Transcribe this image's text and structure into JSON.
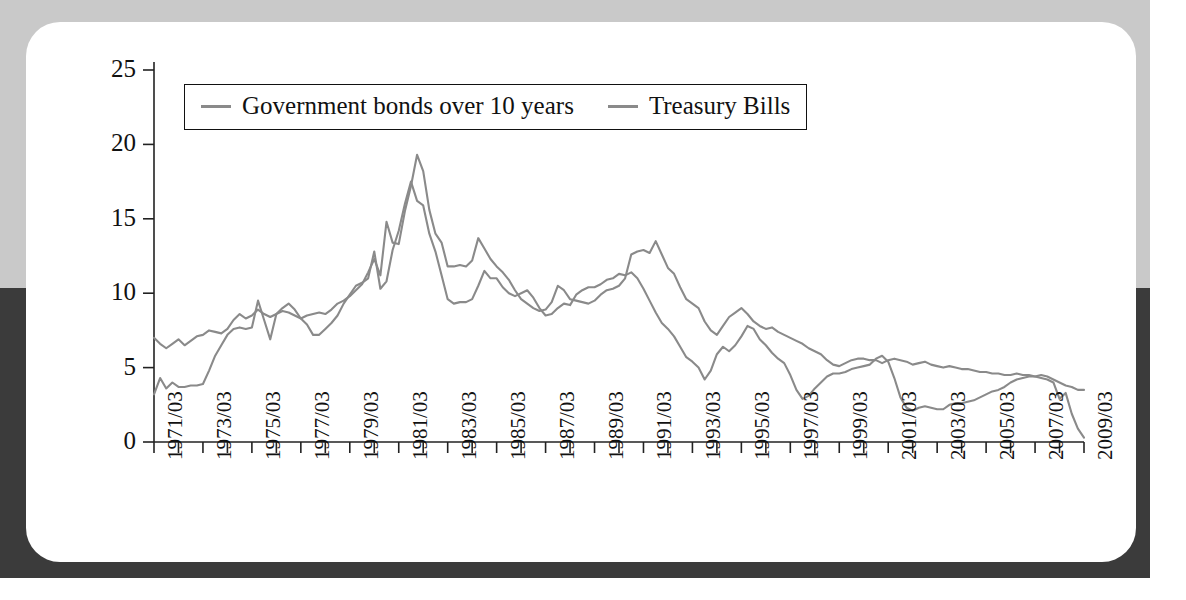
{
  "figure": {
    "card_label": "interest-rate-chart-card",
    "background_top_color": "#c9c9c9",
    "background_bottom_color": "#3b3b3b",
    "line_color": "#8a8a8a",
    "axis_color": "#222222"
  },
  "legend": {
    "position": "top-left-inside",
    "entries": [
      {
        "label": "Government bonds over 10 years",
        "color": "#8a8a8a"
      },
      {
        "label": "Treasury Bills",
        "color": "#8a8a8a"
      }
    ]
  },
  "chart_data": {
    "type": "line",
    "title": "",
    "subtitle": "",
    "xlabel": "",
    "ylabel": "",
    "grid": false,
    "legend_position": "top-left",
    "ylim": [
      0,
      25
    ],
    "yticks": [
      0,
      5,
      10,
      15,
      20,
      25
    ],
    "ytick_labels": [
      "0",
      "5",
      "10",
      "15",
      "20",
      "25"
    ],
    "xlim": [
      "1971/03",
      "2009/03"
    ],
    "xticks": [
      "1971/03",
      "1972/03",
      "1973/03",
      "1974/03",
      "1975/03",
      "1976/03",
      "1977/03",
      "1978/03",
      "1979/03",
      "1980/03",
      "1981/03",
      "1982/03",
      "1983/03",
      "1984/03",
      "1985/03",
      "1986/03",
      "1987/03",
      "1988/03",
      "1989/03",
      "1990/03",
      "1991/03",
      "1992/03",
      "1993/03",
      "1994/03",
      "1995/03",
      "1996/03",
      "1997/03",
      "1998/03",
      "1999/03",
      "2000/03",
      "2001/03",
      "2002/03",
      "2003/03",
      "2004/03",
      "2005/03",
      "2006/03",
      "2007/03",
      "2008/03",
      "2009/03"
    ],
    "xtick_labels_shown": [
      "1971/03",
      "1973/03",
      "1975/03",
      "1977/03",
      "1979/03",
      "1981/03",
      "1983/03",
      "1985/03",
      "1987/03",
      "1989/03",
      "1991/03",
      "1993/03",
      "1995/03",
      "1997/03",
      "1999/03",
      "2001/03",
      "2003/03",
      "2005/03",
      "2007/03",
      "2009/03"
    ],
    "x": [
      1971.2,
      1971.45,
      1971.7,
      1971.95,
      1972.2,
      1972.45,
      1972.7,
      1972.95,
      1973.2,
      1973.45,
      1973.7,
      1973.95,
      1974.2,
      1974.45,
      1974.7,
      1974.95,
      1975.2,
      1975.45,
      1975.7,
      1975.95,
      1976.2,
      1976.45,
      1976.7,
      1976.95,
      1977.2,
      1977.45,
      1977.7,
      1977.95,
      1978.2,
      1978.45,
      1978.7,
      1978.95,
      1979.2,
      1979.45,
      1979.7,
      1979.95,
      1980.2,
      1980.45,
      1980.7,
      1980.95,
      1981.2,
      1981.45,
      1981.7,
      1981.95,
      1982.2,
      1982.45,
      1982.7,
      1982.95,
      1983.2,
      1983.45,
      1983.7,
      1983.95,
      1984.2,
      1984.45,
      1984.7,
      1984.95,
      1985.2,
      1985.45,
      1985.7,
      1985.95,
      1986.2,
      1986.45,
      1986.7,
      1986.95,
      1987.2,
      1987.45,
      1987.7,
      1987.95,
      1988.2,
      1988.45,
      1988.7,
      1988.95,
      1989.2,
      1989.45,
      1989.7,
      1989.95,
      1990.2,
      1990.45,
      1990.7,
      1990.95,
      1991.2,
      1991.45,
      1991.7,
      1991.95,
      1992.2,
      1992.45,
      1992.7,
      1992.95,
      1993.2,
      1993.45,
      1993.7,
      1993.95,
      1994.2,
      1994.45,
      1994.7,
      1994.95,
      1995.2,
      1995.45,
      1995.7,
      1995.95,
      1996.2,
      1996.45,
      1996.7,
      1996.95,
      1997.2,
      1997.45,
      1997.7,
      1997.95,
      1998.2,
      1998.45,
      1998.7,
      1998.95,
      1999.2,
      1999.45,
      1999.7,
      1999.95,
      2000.2,
      2000.45,
      2000.7,
      2000.95,
      2001.2,
      2001.45,
      2001.7,
      2001.95,
      2002.2,
      2002.45,
      2002.7,
      2002.95,
      2003.2,
      2003.45,
      2003.7,
      2003.95,
      2004.2,
      2004.45,
      2004.7,
      2004.95,
      2005.2,
      2005.45,
      2005.7,
      2005.95,
      2006.2,
      2006.45,
      2006.7,
      2006.95,
      2007.2,
      2007.45,
      2007.7,
      2007.95,
      2008.2,
      2008.45,
      2008.7,
      2008.95,
      2009.2
    ],
    "series": [
      {
        "name": "Government bonds over 10 years",
        "color": "#8a8a8a",
        "values": [
          7.0,
          6.6,
          6.3,
          6.6,
          6.9,
          6.5,
          6.8,
          7.1,
          7.2,
          7.5,
          7.4,
          7.3,
          7.6,
          8.2,
          8.6,
          8.3,
          8.5,
          8.9,
          8.6,
          8.4,
          8.6,
          8.8,
          8.7,
          8.5,
          8.3,
          8.5,
          8.6,
          8.7,
          8.6,
          8.9,
          9.3,
          9.5,
          9.8,
          10.2,
          10.6,
          11.4,
          12.3,
          11.2,
          14.8,
          13.4,
          13.3,
          15.5,
          17.2,
          19.3,
          18.2,
          15.6,
          14.0,
          13.4,
          11.8,
          11.8,
          11.9,
          11.8,
          12.2,
          13.7,
          13.0,
          12.3,
          11.8,
          11.4,
          10.9,
          10.2,
          9.6,
          9.3,
          9.0,
          8.8,
          8.9,
          9.4,
          10.5,
          10.2,
          9.6,
          9.5,
          9.4,
          9.3,
          9.5,
          9.9,
          10.2,
          10.3,
          10.5,
          11.0,
          12.6,
          12.8,
          12.9,
          12.7,
          13.5,
          12.6,
          11.7,
          11.3,
          10.4,
          9.6,
          9.3,
          9.0,
          8.1,
          7.5,
          7.2,
          7.8,
          8.4,
          8.7,
          9.0,
          8.6,
          8.1,
          7.8,
          7.6,
          7.7,
          7.4,
          7.2,
          7.0,
          6.8,
          6.6,
          6.3,
          6.1,
          5.9,
          5.5,
          5.2,
          5.1,
          5.3,
          5.5,
          5.6,
          5.6,
          5.5,
          5.5,
          5.3,
          5.5,
          5.6,
          5.5,
          5.4,
          5.2,
          5.3,
          5.4,
          5.2,
          5.1,
          5.0,
          5.1,
          5.0,
          4.9,
          4.9,
          4.8,
          4.7,
          4.7,
          4.6,
          4.6,
          4.5,
          4.5,
          4.6,
          4.5,
          4.5,
          4.4,
          4.5,
          4.4,
          4.2,
          4.0,
          3.8,
          3.7,
          3.5,
          3.5
        ]
      },
      {
        "name": "Treasury Bills",
        "color": "#8a8a8a",
        "values": [
          3.2,
          4.3,
          3.6,
          4.0,
          3.7,
          3.7,
          3.8,
          3.8,
          3.9,
          4.8,
          5.8,
          6.5,
          7.2,
          7.6,
          7.7,
          7.6,
          7.7,
          9.5,
          8.2,
          6.9,
          8.6,
          9.0,
          9.3,
          8.9,
          8.3,
          7.9,
          7.2,
          7.2,
          7.6,
          8.0,
          8.5,
          9.3,
          9.9,
          10.5,
          10.7,
          11.0,
          12.8,
          10.3,
          10.8,
          12.9,
          14.2,
          16.0,
          17.5,
          16.2,
          15.9,
          14.0,
          12.8,
          11.2,
          9.6,
          9.3,
          9.4,
          9.4,
          9.6,
          10.5,
          11.5,
          11.0,
          11.0,
          10.4,
          10.0,
          9.8,
          10.0,
          10.2,
          9.7,
          9.0,
          8.5,
          8.6,
          9.0,
          9.3,
          9.2,
          9.9,
          10.2,
          10.4,
          10.4,
          10.6,
          10.9,
          11.0,
          11.3,
          11.2,
          11.4,
          11.0,
          10.3,
          9.5,
          8.7,
          8.0,
          7.6,
          7.1,
          6.4,
          5.7,
          5.4,
          5.0,
          4.2,
          4.8,
          5.9,
          6.4,
          6.1,
          6.5,
          7.1,
          7.8,
          7.6,
          6.9,
          6.5,
          6.0,
          5.6,
          5.3,
          4.5,
          3.5,
          2.9,
          3.1,
          3.6,
          4.0,
          4.4,
          4.6,
          4.6,
          4.7,
          4.9,
          5.0,
          5.1,
          5.2,
          5.6,
          5.8,
          5.4,
          4.3,
          3.0,
          2.3,
          2.1,
          2.3,
          2.4,
          2.3,
          2.2,
          2.2,
          2.5,
          2.6,
          2.6,
          2.7,
          2.8,
          3.0,
          3.2,
          3.4,
          3.5,
          3.7,
          4.0,
          4.2,
          4.3,
          4.4,
          4.4,
          4.3,
          4.2,
          4.0,
          2.9,
          3.3,
          1.9,
          0.9,
          0.3
        ]
      }
    ]
  }
}
